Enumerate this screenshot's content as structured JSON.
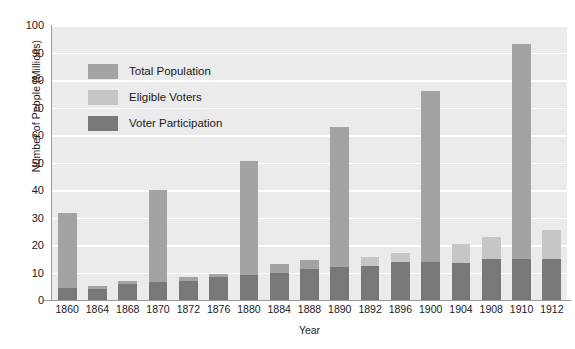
{
  "chart_data": {
    "type": "bar",
    "title": "",
    "subtitle": "",
    "xlabel": "Year",
    "ylabel": "Number of People (Millions)",
    "ylim": [
      0,
      100
    ],
    "yticks": [
      0,
      10,
      20,
      30,
      40,
      50,
      60,
      70,
      80,
      90,
      100
    ],
    "ytick_labels": [
      "0",
      "10",
      "20",
      "30",
      "40",
      "50",
      "60",
      "70",
      "80",
      "90",
      "100"
    ],
    "grid": true,
    "grid_axis": "y",
    "legend_position": "upper-left-inside",
    "stacking": "overlay",
    "categories": [
      "1860",
      "1864",
      "1868",
      "1870",
      "1872",
      "1876",
      "1880",
      "1884",
      "1888",
      "1890",
      "1892",
      "1896",
      "1900",
      "1904",
      "1908",
      "1910",
      "1912"
    ],
    "series": [
      {
        "name": "Total Population",
        "color": "#a3a3a3",
        "values": [
          31.5,
          5.0,
          7.0,
          40.0,
          8.5,
          9.5,
          50.5,
          13.0,
          14.5,
          63.0,
          15.5,
          17.0,
          76.0,
          20.5,
          23.0,
          93.0,
          25.5
        ]
      },
      {
        "name": "Eligible Voters",
        "color": "#c6c6c6",
        "values": [
          0,
          0,
          0,
          0,
          0,
          0,
          0,
          0,
          0,
          0,
          15.5,
          17.0,
          0,
          20.5,
          23.0,
          0,
          25.5
        ]
      },
      {
        "name": "Voter Participation",
        "color": "#787878",
        "values": [
          4.5,
          4.0,
          5.7,
          6.5,
          7.0,
          8.3,
          9.2,
          10.0,
          11.4,
          12.0,
          12.2,
          13.9,
          13.9,
          13.5,
          14.9,
          15.0,
          15.0
        ]
      }
    ]
  },
  "axes": {
    "y_title": "Number of People (Millions)",
    "x_title": "Year"
  },
  "legend": {
    "items": [
      {
        "label": "Total Population",
        "color": "#a3a3a3"
      },
      {
        "label": "Eligible Voters",
        "color": "#c6c6c6"
      },
      {
        "label": "Voter Participation",
        "color": "#787878"
      }
    ]
  },
  "colors": {
    "plot_background": "#ebebeb",
    "gridline": "#ffffff",
    "axis": "#9a9a9a",
    "text": "#1a1a1a"
  }
}
